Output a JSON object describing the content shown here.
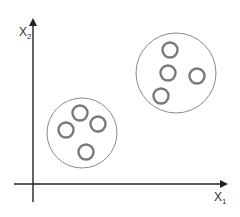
{
  "diagram": {
    "title": "",
    "x_axis_label": "X",
    "x_axis_subscript": "1",
    "y_axis_label": "X",
    "y_axis_subscript": "2",
    "colors": {
      "axis": "#222222",
      "cluster_outline": "#8a8a8a",
      "point_outline": "#7a7a7a",
      "background": "#ffffff"
    },
    "clusters": [
      {
        "name": "cluster-1",
        "center": [
          82,
          133
        ],
        "radius": 35,
        "points": [
          [
            80,
            113
          ],
          [
            66,
            130
          ],
          [
            98,
            124
          ],
          [
            86,
            152
          ]
        ]
      },
      {
        "name": "cluster-2",
        "center": [
          176,
          73
        ],
        "radius": 40,
        "points": [
          [
            170,
            50
          ],
          [
            168,
            73
          ],
          [
            197,
            76
          ],
          [
            161,
            96
          ]
        ]
      }
    ]
  }
}
